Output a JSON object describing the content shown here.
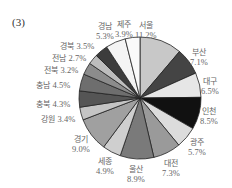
{
  "figure_label": "(3)",
  "chart_data": {
    "type": "pie",
    "title": "",
    "unit": "%",
    "slices": [
      {
        "name": "서울",
        "value": 11.2,
        "color": "#c8c8c8"
      },
      {
        "name": "부산",
        "value": 7.1,
        "color": "#444444"
      },
      {
        "name": "대구",
        "value": 6.5,
        "color": "#e6e6e6"
      },
      {
        "name": "인천",
        "value": 8.5,
        "color": "#111111"
      },
      {
        "name": "광주",
        "value": 5.7,
        "color": "#dcdcdc"
      },
      {
        "name": "대전",
        "value": 7.3,
        "color": "#9a9a9a"
      },
      {
        "name": "울산",
        "value": 8.9,
        "color": "#7a7a7a"
      },
      {
        "name": "세종",
        "value": 4.9,
        "color": "#cfcfcf"
      },
      {
        "name": "경기",
        "value": 9.0,
        "color": "#a0a0a0"
      },
      {
        "name": "강원",
        "value": 3.4,
        "color": "#c4c4c4"
      },
      {
        "name": "충북",
        "value": 4.3,
        "color": "#555555"
      },
      {
        "name": "충남",
        "value": 4.5,
        "color": "#6e6e6e"
      },
      {
        "name": "전북",
        "value": 3.2,
        "color": "#8c8c8c"
      },
      {
        "name": "전남",
        "value": 2.7,
        "color": "#bdbdbd"
      },
      {
        "name": "경북",
        "value": 3.5,
        "color": "#3c3c3c"
      },
      {
        "name": "경남",
        "value": 5.3,
        "color": "#f4f4f4"
      },
      {
        "name": "제주",
        "value": 3.9,
        "color": "#fafafa"
      }
    ]
  },
  "labels": {
    "seoul": {
      "name": "서울",
      "pct": "11.2%"
    },
    "busan": {
      "name": "부산",
      "pct": "7.1%"
    },
    "daegu": {
      "name": "대구",
      "pct": "6.5%"
    },
    "incheon": {
      "name": "인천",
      "pct": "8.5%"
    },
    "gwangju": {
      "name": "광주",
      "pct": "5.7%"
    },
    "daejeon": {
      "name": "대전",
      "pct": "7.3%"
    },
    "ulsan": {
      "name": "울산",
      "pct": "8.9%"
    },
    "sejong": {
      "name": "세종",
      "pct": "4.9%"
    },
    "gyeonggi": {
      "name": "경기",
      "pct": "9.0%"
    },
    "gangwon": {
      "name": "강원",
      "pct": "3.4%"
    },
    "chungbuk": {
      "name": "충북",
      "pct": "4.3%"
    },
    "chungnam": {
      "name": "충남",
      "pct": "4.5%"
    },
    "jeonbuk": {
      "name": "전북",
      "pct": "3.2%"
    },
    "jeonnam": {
      "name": "전남",
      "pct": "2.7%"
    },
    "gyeongbuk": {
      "name": "경북",
      "pct": "3.5%"
    },
    "gyeongnam": {
      "name": "경남",
      "pct": "5.3%"
    },
    "jeju": {
      "name": "제주",
      "pct": "3.9%"
    }
  }
}
